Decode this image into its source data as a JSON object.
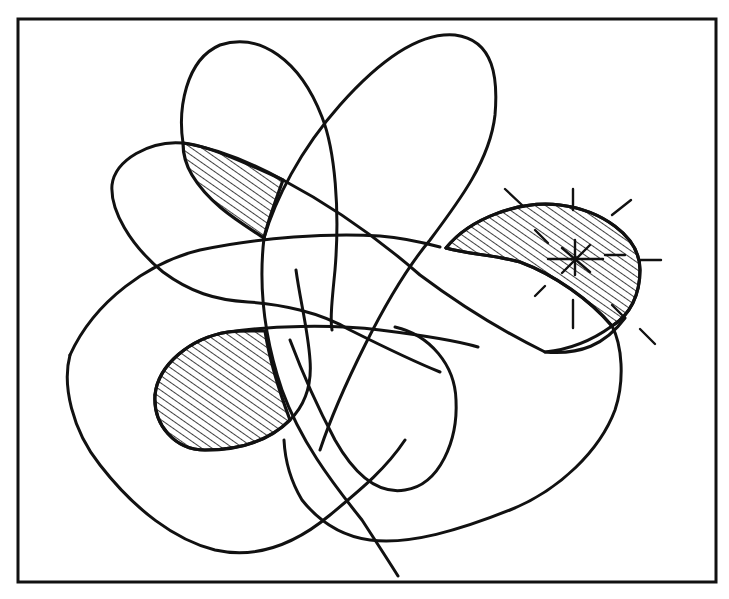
{
  "figure": {
    "width": 729,
    "height": 599,
    "background": "#ffffff",
    "ink_color": "#111111",
    "frame": {
      "x": 18,
      "y": 19,
      "width": 698,
      "height": 272,
      "x2": 716,
      "y2": 291
    },
    "frame_rect": {
      "x": 18,
      "y": 19,
      "w": 698,
      "h": 273
    },
    "border": {
      "x": 18,
      "y": 19,
      "w": 698,
      "h": 563,
      "stroke_width": 3
    },
    "hatch": {
      "spacing": 6,
      "angle": -55,
      "stroke_width": 1.4
    },
    "regions": [
      {
        "name": "upper-left-hatched-region",
        "path": "M183 143 C205 145 240 160 283 180 C276 200 268 220 264 238 C240 222 210 205 192 175 C186 165 183 152 183 143 Z"
      },
      {
        "name": "right-hatched-crescent",
        "path": "M446 248 C470 218 520 200 560 205 C600 210 640 235 640 270 C640 295 630 315 612 326 C590 300 555 275 520 262 C495 255 466 254 446 248 Z"
      },
      {
        "name": "lower-left-hatched-region",
        "path": "M155 395 C158 365 190 338 228 332 C245 330 258 331 265 331 C268 350 275 380 290 420 C270 440 240 450 205 450 C175 450 153 425 155 395 Z"
      }
    ],
    "curves": [
      {
        "name": "top-left-loop",
        "d": "M183 143 C178 110 185 60 220 45 C260 32 300 60 322 117 C335 150 340 210 335 270 C332 300 330 320 332 330"
      },
      {
        "name": "left-petal-loop",
        "d": "M183 143 C150 140 115 160 112 185 C110 210 130 245 163 272 C190 292 215 300 248 302 C280 304 320 312 350 330 C380 345 410 360 440 372"
      },
      {
        "name": "upper-left-diagonal-stroke",
        "d": "M183 143 C215 148 250 162 283 180 C330 205 380 240 420 275 C460 305 500 330 545 352 C580 355 605 345 625 318"
      },
      {
        "name": "top-right-loop",
        "d": "M264 238 C275 200 300 150 340 105 C380 60 420 32 455 35 C495 40 498 80 495 115 C490 160 460 200 430 240 C405 270 385 305 365 345 C345 385 330 420 320 450"
      },
      {
        "name": "crescent-top-edge",
        "d": "M446 248 C470 218 520 200 560 205 C600 210 640 235 640 270 C640 295 630 315 612 326"
      },
      {
        "name": "crescent-bottom-edge",
        "d": "M446 248 C466 254 495 255 520 262 C555 275 590 300 612 326"
      },
      {
        "name": "horizontal-sweep-to-crescent",
        "d": "M70 355 C95 300 150 262 200 250 C260 237 330 233 380 236 C405 238 425 243 440 247"
      },
      {
        "name": "big-outer-loop",
        "d": "M70 355 C62 385 72 430 100 465 C135 510 175 540 215 550 C260 560 300 540 330 515 C360 490 385 470 405 440"
      },
      {
        "name": "lower-left-loop-boundary",
        "d": "M155 395 C158 365 190 338 228 332 C270 326 330 324 380 330 C420 335 455 340 478 347"
      },
      {
        "name": "lower-left-loop-bottom",
        "d": "M155 395 C153 425 175 450 205 450 C240 450 270 440 290 420 C305 405 312 385 310 360 C308 330 300 300 296 270"
      },
      {
        "name": "center-vertical-loop",
        "d": "M264 238 C258 290 265 340 282 390 C300 440 330 480 362 520 C375 540 388 560 398 576"
      },
      {
        "name": "right-inner-loop",
        "d": "M395 327 C430 335 455 365 456 400 C458 440 440 485 405 490 C375 495 352 470 335 440 C318 408 305 380 290 340"
      },
      {
        "name": "bottom-right-sweep",
        "d": "M612 326 C622 345 625 380 615 410 C600 450 560 490 510 510 C460 530 410 545 370 540 C340 536 318 520 302 500 C290 480 285 460 284 440"
      },
      {
        "name": "right-connector",
        "d": "M545 352 C565 350 590 342 612 326"
      }
    ],
    "sparkle": {
      "name": "sparkle-burst",
      "center": {
        "x": 575,
        "y": 258
      },
      "rays": [
        {
          "x1": 505,
          "y1": 189,
          "x2": 522,
          "y2": 205
        },
        {
          "x1": 573,
          "y1": 189,
          "x2": 573,
          "y2": 210
        },
        {
          "x1": 612,
          "y1": 215,
          "x2": 631,
          "y2": 200
        },
        {
          "x1": 640,
          "y1": 260,
          "x2": 661,
          "y2": 260
        },
        {
          "x1": 640,
          "y1": 329,
          "x2": 655,
          "y2": 344
        },
        {
          "x1": 573,
          "y1": 300,
          "x2": 573,
          "y2": 328
        },
        {
          "x1": 545,
          "y1": 286,
          "x2": 535,
          "y2": 296
        },
        {
          "x1": 535,
          "y1": 230,
          "x2": 548,
          "y2": 243
        },
        {
          "x1": 562,
          "y1": 248,
          "x2": 590,
          "y2": 272
        },
        {
          "x1": 590,
          "y1": 245,
          "x2": 562,
          "y2": 273
        },
        {
          "x1": 548,
          "y1": 259,
          "x2": 603,
          "y2": 259
        },
        {
          "x1": 575,
          "y1": 240,
          "x2": 575,
          "y2": 275
        },
        {
          "x1": 605,
          "y1": 255,
          "x2": 625,
          "y2": 255
        },
        {
          "x1": 612,
          "y1": 305,
          "x2": 622,
          "y2": 315
        }
      ]
    }
  }
}
